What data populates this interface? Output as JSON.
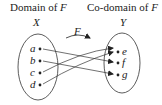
{
  "headers": {
    "domain_label": "Domain of ",
    "codomain_label": "Co-domain of ",
    "function_name": "F"
  },
  "sets": {
    "domain_name": "X",
    "codomain_name": "Y"
  },
  "function_arrow_label": "F",
  "domain_elements": [
    "a",
    "b",
    "c",
    "d"
  ],
  "codomain_elements": [
    "e",
    "f",
    "g"
  ],
  "mappings": [
    {
      "from": "a",
      "to": "f"
    },
    {
      "from": "b",
      "to": "g"
    },
    {
      "from": "c",
      "to": "e"
    },
    {
      "from": "d",
      "to": "e"
    }
  ]
}
